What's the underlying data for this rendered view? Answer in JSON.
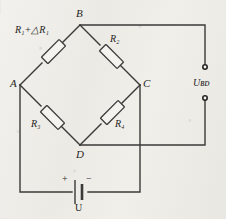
{
  "diagram": {
    "nodes": [
      {
        "id": "A",
        "label": "A",
        "x": 20,
        "y": 85
      },
      {
        "id": "B",
        "label": "B",
        "x": 80,
        "y": 25
      },
      {
        "id": "C",
        "label": "C",
        "x": 140,
        "y": 85
      },
      {
        "id": "D",
        "label": "D",
        "x": 80,
        "y": 145
      }
    ],
    "resistors": [
      {
        "id": "r-ab",
        "label": "R",
        "sub": "1",
        "expr_op": "+",
        "expr_delta": "△",
        "expr_label2": "R",
        "expr_sub2": "1",
        "branch": "A-B"
      },
      {
        "id": "r-bc",
        "label": "R",
        "sub": "2",
        "branch": "B-C"
      },
      {
        "id": "r-ad",
        "label": "R",
        "sub": "3",
        "branch": "A-D"
      },
      {
        "id": "r-dc",
        "label": "R",
        "sub": "4",
        "branch": "D-C"
      }
    ],
    "output": {
      "label": "U",
      "sub": "BD",
      "terminal_top_name": "output-terminal-top",
      "terminal_bottom_name": "output-terminal-bottom"
    },
    "source": {
      "label": "U",
      "plus": "+",
      "minus": "−"
    },
    "labels": {
      "expr_ab": "R₁+△R₁",
      "r2": "R₂",
      "r3": "R₃",
      "r4": "R₄",
      "u_bd": "Uʙᴅ",
      "u_source": "U",
      "node_a": "A",
      "node_b": "B",
      "node_c": "C",
      "node_d": "D"
    }
  },
  "colors": {
    "ink": "#3a3a38",
    "paper": "#efeeea"
  }
}
